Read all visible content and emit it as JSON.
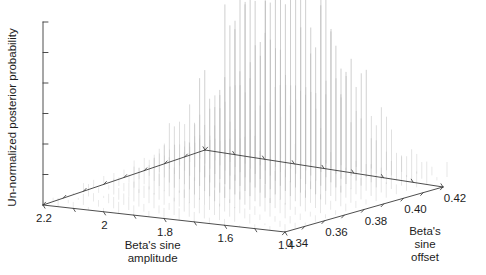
{
  "figure": {
    "background_color": "#ffffff",
    "axis_color": "#3a3a3a",
    "stem_color": "#b9b9b9",
    "text_color": "#1d1d1d"
  },
  "chart_data": {
    "type": "scatter",
    "render_style": "3d-stem",
    "title": "",
    "xlabel": "Beta's sine amplitude",
    "ylabel": "Beta's sine offset",
    "zlabel": "Un-normalized posterior probability",
    "xlabel_lines": [
      "Beta's sine",
      "amplitude"
    ],
    "ylabel_lines": [
      "Beta's",
      "sine",
      "offset"
    ],
    "x_ticks": [
      "2.2",
      "2",
      "1.8",
      "1.6",
      "1.4"
    ],
    "x_tick_values": [
      2.2,
      2.0,
      1.8,
      1.6,
      1.4
    ],
    "y_ticks": [
      "0.34",
      "0.36",
      "0.38",
      "0.40",
      "0.42"
    ],
    "y_tick_values": [
      0.34,
      0.36,
      0.38,
      0.4,
      0.42
    ],
    "z_ticks": [],
    "z_tick_count": 6,
    "z_tick_labels_shown": false,
    "xlim": [
      1.4,
      2.2
    ],
    "ylim": [
      0.34,
      0.42
    ],
    "zlim": [
      0,
      1
    ],
    "grid": false,
    "legend": null,
    "minor_ticks_per_interval": 2,
    "grid_nx": 17,
    "grid_ny": 17,
    "peak_x": 1.78,
    "peak_y": 0.393,
    "peak_value": 1.0,
    "sigma_x": 0.155,
    "sigma_y": 0.018,
    "noise_amount": 0.34,
    "values_note": "Un-normalized posterior probability sampled on a 17x17 grid over amplitude x offset; noisy unimodal surface peaking near amplitude 1.78, offset 0.393."
  },
  "geometry": {
    "origin_left": [
      43,
      205
    ],
    "corner_front": [
      285,
      232
    ],
    "corner_right": [
      443,
      187
    ],
    "corner_back": [
      205,
      150
    ],
    "z_axis_top": [
      43,
      22
    ],
    "z_axis_height": 183
  }
}
